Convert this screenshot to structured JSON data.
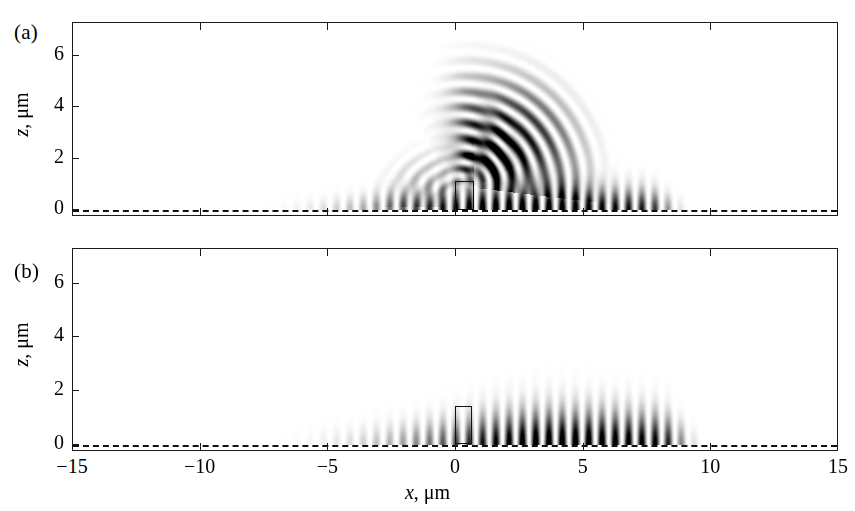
{
  "figure": {
    "panels": [
      {
        "tag": "(a)"
      },
      {
        "tag": "(b)"
      }
    ],
    "axes": {
      "xlabel_var": "x",
      "xlabel_unit": ", μm",
      "ylabel_var": "z",
      "ylabel_unit": ", μm",
      "xticks": [
        -15,
        -10,
        -5,
        0,
        5,
        10,
        15
      ],
      "xtick_labels": [
        "−15",
        "−10",
        "−5",
        "0",
        "5",
        "10",
        "15"
      ],
      "yticks": [
        0,
        2,
        4,
        6
      ],
      "ytick_labels": [
        "0",
        "2",
        "4",
        "6"
      ],
      "xlim": [
        -15,
        15
      ],
      "ylim": [
        -0.28,
        7.3
      ]
    },
    "colors": {
      "ink": "#111111",
      "frame": "#1a1a1a",
      "background": "#ffffff"
    }
  },
  "chart_data": {
    "type": "heatmap",
    "title": "",
    "xlabel": "x, μm",
    "ylabel": "z, μm",
    "xlim": [
      -15,
      15
    ],
    "ylim": [
      -0.28,
      7.3
    ],
    "grid": false,
    "legend": null,
    "colormap": "grayscale (white = 0, black = max intensity)",
    "panels": [
      {
        "tag": "(a)",
        "description": "Near-field intensity with surface standing-wave fringes plus a bright curved caustic fan radiating upward to z about 6 um over x about 0 to 6 um",
        "fringe_extent_x": [
          -8.0,
          9.0
        ],
        "fringe_period_um": 0.52,
        "fringe_max_height_um": 1.5,
        "envelope_peak_x": 2.0,
        "caustic_present": true,
        "caustic_origin": [
          0.4,
          0.9
        ],
        "caustic_max_z": 6.2,
        "caustic_x_span": [
          -1.0,
          7.5
        ],
        "roi_box": {
          "x0": -0.05,
          "x1": 0.72,
          "z0": 0.0,
          "z1": 1.12
        },
        "dashed_surface_z": 0
      },
      {
        "tag": "(b)",
        "description": "Same geometry without the caustic: only vertical surface fringes, weaker and lower, peaking near x about 4 um",
        "fringe_extent_x": [
          -7.6,
          9.5
        ],
        "fringe_period_um": 0.52,
        "fringe_max_height_um": 2.0,
        "envelope_peak_x": 4.0,
        "caustic_present": false,
        "roi_box": {
          "x0": -0.05,
          "x1": 0.62,
          "z0": 0.0,
          "z1": 1.42
        },
        "dashed_surface_z": 0
      }
    ]
  }
}
